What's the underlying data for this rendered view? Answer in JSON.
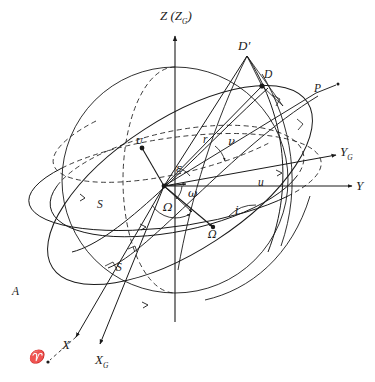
{
  "figure": {
    "kind": "orbital-elements-diagram"
  },
  "axes": [
    {
      "id": "z",
      "label": "Z (Z",
      "sublabel": "G",
      "close": ")",
      "name": "z-axis"
    },
    {
      "id": "y",
      "label": "Y",
      "sublabel": "",
      "close": "",
      "name": "y-axis"
    },
    {
      "id": "yg",
      "label": "Y",
      "sublabel": "G",
      "close": "",
      "name": "yg-axis"
    },
    {
      "id": "x",
      "label": "X",
      "sublabel": "",
      "close": "",
      "name": "x-axis"
    },
    {
      "id": "xg",
      "label": "X",
      "sublabel": "G",
      "close": "",
      "name": "xg-axis"
    }
  ],
  "labels": {
    "z_axis": "Z (Z",
    "z_axis_sub": "G",
    "z_axis_close": ")",
    "y_axis": "Y",
    "yg_axis": "Y",
    "yg_axis_sub": "G",
    "x_axis": "X",
    "xg_axis": "X",
    "xg_axis_sub": "G",
    "vernal_equinox": "♈",
    "point_A": "A",
    "point_D": "D",
    "point_D_prime": "D",
    "point_D_prime_mark": "′",
    "point_P": "P",
    "radius_r": "r",
    "true_anomaly": "ν",
    "arg_latitude": "u",
    "inclination": "i",
    "obliquity": "ε",
    "arg_perigee": "ω",
    "raan": "Ω",
    "asc_node_point": "Ω",
    "sidereal_S1": "S",
    "sidereal_S2": "S",
    "node_u_left": "ᴜ"
  },
  "colors": {
    "ink": "#1a1a1a",
    "background": "#ffffff",
    "dashed": "#555555"
  },
  "geometry": {
    "center": {
      "x": 164,
      "y": 186
    },
    "sphere": {
      "cx": 175,
      "cy": 180,
      "r": 113
    },
    "equator_ellipse": {
      "rx": 113,
      "ry": 34,
      "rot": -8
    },
    "ecliptic_ellipse": {
      "rx": 118,
      "ry": 44,
      "rot": -12
    },
    "orbit_ellipse": {
      "rx": 148,
      "ry": 62,
      "rot": -34
    }
  }
}
